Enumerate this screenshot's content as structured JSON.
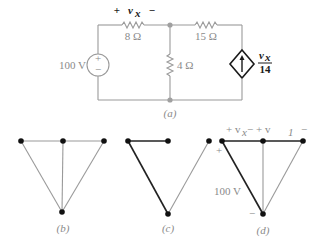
{
  "figure": {
    "a": {
      "caption": "(a)",
      "source_voltage": "100 V",
      "source_plus": "+",
      "source_minus": "−",
      "r1": "8 Ω",
      "r2": "4 Ω",
      "r3": "15 Ω",
      "vx_plus": "+",
      "vx_label": "v",
      "vx_sub": "x",
      "vx_minus": "−",
      "dep_num": "v",
      "dep_num_sub": "x",
      "dep_den": "14"
    },
    "b": {
      "caption": "(b)"
    },
    "c": {
      "caption": "(c)"
    },
    "d": {
      "caption": "(d)",
      "top_labels": "+ v",
      "vx_sub": "x",
      "mid": " − +  v",
      "v1_sub": "1",
      "end_minus": "−",
      "plus": "+",
      "minus": "−",
      "source": "100 V"
    }
  }
}
